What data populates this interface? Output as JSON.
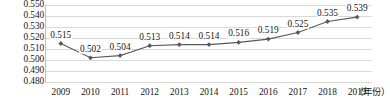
{
  "chart_data": {
    "type": "line",
    "title": "",
    "xlabel": "（年份）",
    "ylabel": "",
    "categories": [
      "2009",
      "2010",
      "2011",
      "2012",
      "2013",
      "2014",
      "2015",
      "2016",
      "2017",
      "2018",
      "2019"
    ],
    "values": [
      0.515,
      0.502,
      0.504,
      0.513,
      0.514,
      0.514,
      0.516,
      0.519,
      0.525,
      0.535,
      0.539
    ],
    "point_labels": [
      "0.515",
      "0.502",
      "0.504",
      "0.513",
      "0.514",
      "0.514",
      "0.516",
      "0.519",
      "0.525",
      "0.535",
      "0.539"
    ],
    "ylim": [
      0.48,
      0.55
    ],
    "ytick_values": [
      0.55,
      0.54,
      0.53,
      0.52,
      0.51,
      0.5,
      0.49,
      0.48
    ],
    "ytick_labels": [
      "0.550",
      "0.540",
      "0.530",
      "0.520",
      "0.510",
      "0.500",
      "0.490",
      "0.480"
    ],
    "grid": true,
    "legend": false,
    "marker": "diamond",
    "series_color": "#595959",
    "grid_color": "#d9d9d9",
    "text_color": "#141414"
  },
  "axis": {
    "x_unit": "（年份）"
  }
}
